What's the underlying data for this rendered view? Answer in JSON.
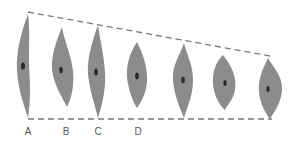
{
  "diagram": {
    "colors": {
      "cell_fill": "#8c8c8c",
      "nucleus": "#2a2a2a",
      "guide_line": "#7a7a7a",
      "label": "#555555"
    },
    "labels": [
      "A",
      "B",
      "C",
      "D"
    ],
    "cell_count": 7
  }
}
